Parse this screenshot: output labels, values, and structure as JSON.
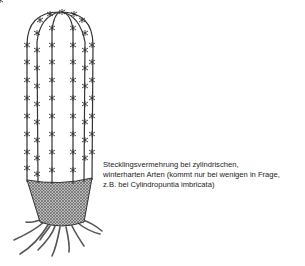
{
  "diagram": {
    "caption": {
      "lines": [
        "Stecklingsvermehrung bei zylindrischen,",
        "winterharten Arten (kommt  nur bei wenigen in Frage,",
        "z.B. bei Cylindropuntia imbricata)"
      ]
    },
    "colors": {
      "line": "#333333",
      "soil_fill": "#888888",
      "background": "#ffffff"
    }
  }
}
